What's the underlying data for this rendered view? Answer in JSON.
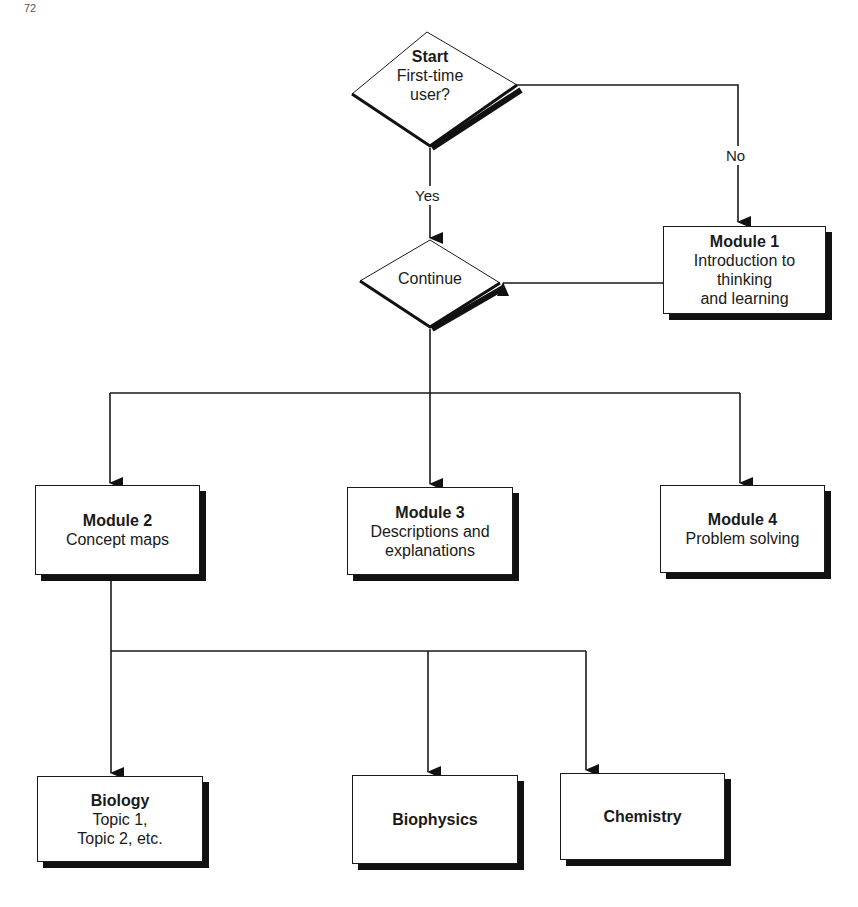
{
  "page_number": "72",
  "decisions": {
    "start": {
      "title": "Start",
      "lines": [
        "First-time",
        "user?"
      ]
    },
    "continue": {
      "title": "",
      "lines": [
        "Continue"
      ]
    }
  },
  "edge_labels": {
    "yes": "Yes",
    "no": "No"
  },
  "modules": {
    "m1": {
      "title": "Module 1",
      "lines": [
        "Introduction to",
        "thinking",
        "and learning"
      ]
    },
    "m2": {
      "title": "Module 2",
      "lines": [
        "Concept maps"
      ]
    },
    "m3": {
      "title": "Module 3",
      "lines": [
        "Descriptions and",
        "explanations"
      ]
    },
    "m4": {
      "title": "Module 4",
      "lines": [
        "Problem solving"
      ]
    }
  },
  "topics": {
    "biology": {
      "title": "Biology",
      "lines": [
        "Topic 1,",
        "Topic 2, etc."
      ]
    },
    "biophysics": {
      "title": "Biophysics",
      "lines": []
    },
    "chemistry": {
      "title": "Chemistry",
      "lines": []
    }
  },
  "colors": {
    "line": "#1a1a1a",
    "shadow": "#111111",
    "background": "#ffffff"
  }
}
